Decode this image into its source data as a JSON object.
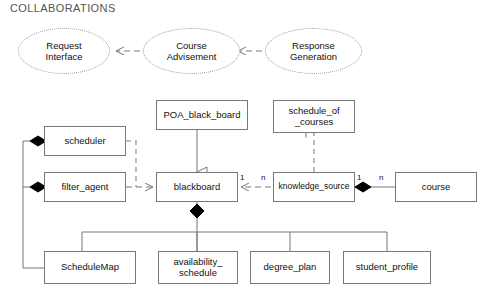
{
  "diagram": {
    "title": "COLLABORATIONS",
    "type": "uml-class-collaboration-diagram",
    "colors": {
      "line": "#777777",
      "fill": "#ffffff",
      "text": "#111111",
      "title_text": "#555555",
      "diamond": "#000000",
      "ellipse_border": "#999999"
    },
    "collaborations": [
      {
        "id": "request-interface",
        "label": "Request\nInterface",
        "x": 18,
        "y": 28,
        "w": 92,
        "h": 46
      },
      {
        "id": "course-advisement",
        "label": "Course\nAdvisement",
        "x": 143,
        "y": 28,
        "w": 97,
        "h": 46
      },
      {
        "id": "response-generation",
        "label": "Response\nGeneration",
        "x": 265,
        "y": 28,
        "w": 97,
        "h": 46
      }
    ],
    "classes": [
      {
        "id": "poa-black-board",
        "label": "POA_black_board",
        "x": 156,
        "y": 100,
        "w": 92,
        "h": 30
      },
      {
        "id": "schedule-of-courses",
        "label": "schedule_of\n_courses",
        "x": 273,
        "y": 100,
        "w": 82,
        "h": 33
      },
      {
        "id": "scheduler",
        "label": "scheduler",
        "x": 44,
        "y": 126,
        "w": 82,
        "h": 30
      },
      {
        "id": "filter-agent",
        "label": "filter_agent",
        "x": 44,
        "y": 172,
        "w": 82,
        "h": 30
      },
      {
        "id": "blackboard",
        "label": "blackboard",
        "x": 156,
        "y": 172,
        "w": 82,
        "h": 30
      },
      {
        "id": "knowledge-source",
        "label": "knowledge_source",
        "x": 273,
        "y": 172,
        "w": 82,
        "h": 30
      },
      {
        "id": "course",
        "label": "course",
        "x": 395,
        "y": 172,
        "w": 82,
        "h": 30
      },
      {
        "id": "schedule-map",
        "label": "ScheduleMap",
        "x": 44,
        "y": 251,
        "w": 92,
        "h": 33
      },
      {
        "id": "availability-schedule",
        "label": "availability_\nschedule",
        "x": 158,
        "y": 251,
        "w": 80,
        "h": 33
      },
      {
        "id": "degree-plan",
        "label": "degree_plan",
        "x": 250,
        "y": 251,
        "w": 80,
        "h": 33
      },
      {
        "id": "student-profile",
        "label": "student_profile",
        "x": 343,
        "y": 251,
        "w": 88,
        "h": 33
      }
    ],
    "multiplicity_labels": [
      {
        "id": "blackboard-to-ks-near",
        "text": "1",
        "x": 240,
        "y": 174
      },
      {
        "id": "ks-to-blackboard-near",
        "text": "n",
        "x": 260,
        "y": 174
      },
      {
        "id": "ks-to-course-near",
        "text": "1",
        "x": 357,
        "y": 174
      },
      {
        "id": "course-to-ks-near",
        "text": "n",
        "x": 378,
        "y": 174
      }
    ],
    "relationships": [
      {
        "id": "request-to-course-advisement",
        "from": "course-advisement",
        "to": "request-interface",
        "style": "dashed",
        "arrow": "open"
      },
      {
        "id": "course-advisement-to-response",
        "from": "response-generation",
        "to": "course-advisement",
        "style": "dashed",
        "arrow": "open"
      },
      {
        "id": "poa-to-blackboard",
        "from": "poa-black-board",
        "to": "blackboard",
        "style": "solid",
        "arrow": "generalization-triangle"
      },
      {
        "id": "ks-to-schedule-of-courses",
        "from": "knowledge-source",
        "to": "schedule-of-courses",
        "style": "dashed",
        "arrow": "open"
      },
      {
        "id": "filter-agent-to-blackboard",
        "from": "filter-agent",
        "to": "blackboard",
        "style": "dashed",
        "arrow": "open"
      },
      {
        "id": "scheduler-to-blackboard",
        "from": "scheduler",
        "to": "blackboard",
        "style": "dashed",
        "arrow": "none"
      },
      {
        "id": "blackboard-to-knowledge-source",
        "from": "blackboard",
        "to": "knowledge-source",
        "style": "dashed",
        "arrow": "open",
        "mult_source": "1",
        "mult_target": "n"
      },
      {
        "id": "knowledge-source-to-course",
        "from": "knowledge-source",
        "to": "course",
        "style": "solid",
        "arrow": "composition-diamond",
        "mult_source": "1",
        "mult_target": "n"
      },
      {
        "id": "schedule-map-to-scheduler",
        "from": "schedule-map",
        "to": "scheduler",
        "style": "solid",
        "arrow": "composition-diamond"
      },
      {
        "id": "schedule-map-to-filter-agent",
        "from": "schedule-map",
        "to": "filter-agent",
        "style": "solid",
        "arrow": "composition-diamond"
      },
      {
        "id": "blackboard-to-parts-bus",
        "from": "blackboard",
        "to": "bottom-bus",
        "style": "solid",
        "arrow": "composition-diamond"
      }
    ]
  }
}
